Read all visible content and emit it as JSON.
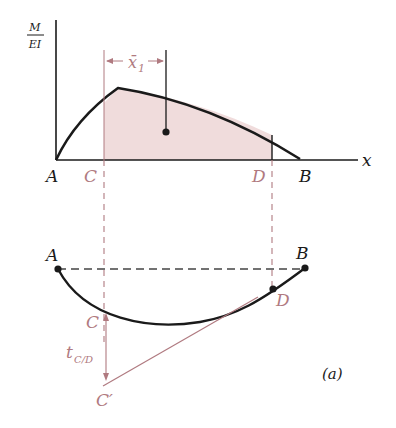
{
  "figure": {
    "caption": "(a)",
    "colors": {
      "ink": "#1a1a1a",
      "accent": "#b07a80",
      "fill": "#f0dcdc",
      "background": "#ffffff"
    }
  },
  "mdiagram": {
    "y_axis_label_num": "M",
    "y_axis_label_den": "EI",
    "x_axis_label": "x",
    "xbar_label": "x̄",
    "xbar_subscript": "1",
    "points": {
      "A": "A",
      "C": "C",
      "D": "D",
      "B": "B"
    }
  },
  "deflection": {
    "points": {
      "A": "A",
      "B": "B",
      "C": "C",
      "D": "D",
      "Cprime": "C′"
    },
    "tangent_deviation_label": "t",
    "tangent_deviation_subscript": "C/D"
  }
}
